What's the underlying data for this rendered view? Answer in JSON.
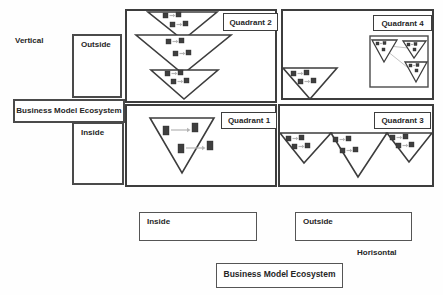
{
  "axis": {
    "vertical": "Vertical",
    "horizontal": "Horisontal"
  },
  "left_column": {
    "outside": "Outside",
    "ecosystem": "Business Model Ecosystem",
    "inside": "Inside"
  },
  "bottom_row": {
    "inside": "Inside",
    "outside": "Outside",
    "ecosystem": "Business  Model Ecosystem"
  },
  "quadrants": {
    "q1": "Quadrant 1",
    "q2": "Quadrant 2",
    "q3": "Quadrant 3",
    "q4": "Quadrant 4"
  },
  "colors": {
    "line": "#3d3d3d",
    "text": "#262626",
    "node_square": "#3f3f3f",
    "arrow": "#b4b4b4",
    "background": "#fefefe"
  }
}
